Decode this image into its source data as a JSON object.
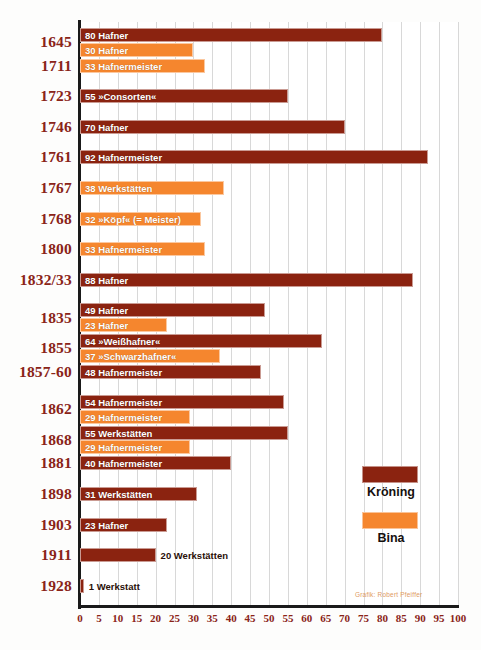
{
  "chart_data": {
    "type": "bar",
    "orientation": "horizontal",
    "title": "",
    "xlabel": "",
    "ylabel": "",
    "xlim": [
      0,
      100
    ],
    "xticks": [
      0,
      5,
      10,
      15,
      20,
      25,
      30,
      35,
      40,
      45,
      50,
      55,
      60,
      65,
      70,
      75,
      80,
      85,
      90,
      95,
      100
    ],
    "grid": true,
    "legend_position": "inside-right",
    "colors": {
      "kroening": "#8b2310",
      "bina": "#f5862e",
      "year_label": "#8a2418",
      "axis": "#1a1a1a",
      "gridline": "#d8d8d8",
      "background": "#ffffff",
      "bar_label_text": "#ffffff",
      "credit_text": "#e09a5f"
    },
    "series": [
      {
        "name": "Kröning",
        "color": "#8b2310"
      },
      {
        "name": "Bina",
        "color": "#f5862e"
      }
    ],
    "categories": [
      "1645",
      "1711",
      "1723",
      "1746",
      "1761",
      "1767",
      "1768",
      "1800",
      "1832/33",
      "1835",
      "1855",
      "1857-60",
      "1862",
      "1868",
      "1881",
      "1898",
      "1903",
      "1911",
      "1928"
    ],
    "rows": [
      {
        "year": "1645",
        "bars": [
          {
            "series": "Kröning",
            "value": 80,
            "label": "80 Hafner"
          },
          {
            "series": "Bina",
            "value": 30,
            "label": "30 Hafner"
          }
        ]
      },
      {
        "year": "1711",
        "bars": [
          {
            "series": "Bina",
            "value": 33,
            "label": "33 Hafnermeister"
          }
        ]
      },
      {
        "year": "1723",
        "bars": [
          {
            "series": "Kröning",
            "value": 55,
            "label": "55 »Consorten«"
          }
        ]
      },
      {
        "year": "1746",
        "bars": [
          {
            "series": "Kröning",
            "value": 70,
            "label": "70 Hafner"
          }
        ]
      },
      {
        "year": "1761",
        "bars": [
          {
            "series": "Kröning",
            "value": 92,
            "label": "92 Hafnermeister"
          }
        ]
      },
      {
        "year": "1767",
        "bars": [
          {
            "series": "Bina",
            "value": 38,
            "label": "38 Werkstätten"
          }
        ]
      },
      {
        "year": "1768",
        "bars": [
          {
            "series": "Bina",
            "value": 32,
            "label": "32 »Köpf« (= Meister)"
          }
        ]
      },
      {
        "year": "1800",
        "bars": [
          {
            "series": "Bina",
            "value": 33,
            "label": "33 Hafnermeister"
          }
        ]
      },
      {
        "year": "1832/33",
        "bars": [
          {
            "series": "Kröning",
            "value": 88,
            "label": "88 Hafner"
          }
        ]
      },
      {
        "year": "1835",
        "bars": [
          {
            "series": "Kröning",
            "value": 49,
            "label": "49 Hafner"
          },
          {
            "series": "Bina",
            "value": 23,
            "label": "23 Hafner"
          }
        ]
      },
      {
        "year": "1855",
        "bars": [
          {
            "series": "Kröning",
            "value": 64,
            "label": "64 »Weißhafner«"
          },
          {
            "series": "Bina",
            "value": 37,
            "label": "37 »Schwarzhafner«"
          }
        ]
      },
      {
        "year": "1857-60",
        "bars": [
          {
            "series": "Kröning",
            "value": 48,
            "label": "48 Hafnermeister"
          }
        ]
      },
      {
        "year": "1862",
        "bars": [
          {
            "series": "Kröning",
            "value": 54,
            "label": "54 Hafnermeister"
          },
          {
            "series": "Bina",
            "value": 29,
            "label": "29 Hafnermeister"
          }
        ]
      },
      {
        "year": "1868",
        "bars": [
          {
            "series": "Kröning",
            "value": 55,
            "label": "55 Werkstätten"
          },
          {
            "series": "Bina",
            "value": 29,
            "label": "29 Hafnermeister"
          }
        ]
      },
      {
        "year": "1881",
        "bars": [
          {
            "series": "Kröning",
            "value": 40,
            "label": "40 Hafnermeister"
          }
        ]
      },
      {
        "year": "1898",
        "bars": [
          {
            "series": "Kröning",
            "value": 31,
            "label": "31 Werkstätten"
          }
        ]
      },
      {
        "year": "1903",
        "bars": [
          {
            "series": "Kröning",
            "value": 23,
            "label": "23 Hafner"
          }
        ]
      },
      {
        "year": "1911",
        "bars": [
          {
            "series": "Kröning",
            "value": 20,
            "label": "20 Werkstätten"
          }
        ]
      },
      {
        "year": "1928",
        "bars": [
          {
            "series": "Kröning",
            "value": 1,
            "label": "1 Werkstatt"
          }
        ]
      }
    ]
  },
  "legend": {
    "items": [
      {
        "name": "Kröning",
        "series": "kroening"
      },
      {
        "name": "Bina",
        "series": "bina"
      }
    ]
  },
  "credit": {
    "text": "Grafik: Robert Pfeiffer"
  }
}
